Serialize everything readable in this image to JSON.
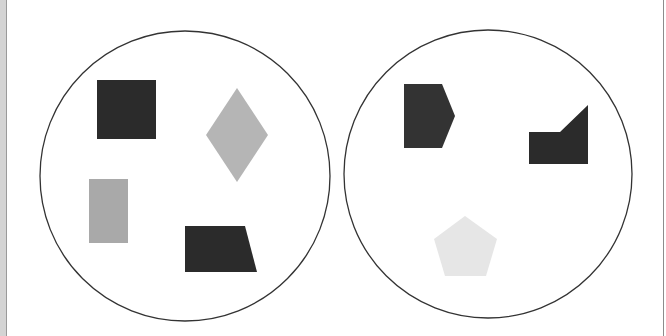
{
  "figure": {
    "width": 666,
    "height": 336,
    "background": "#ffffff",
    "panels": [
      {
        "name": "left-circle",
        "circle": {
          "cx": 185,
          "cy": 176,
          "r": 145,
          "stroke": "#333333"
        },
        "shapes": [
          {
            "type": "square",
            "color": "dark",
            "fill": "#2b2b2b",
            "points": "97,80 156,80 156,139 97,139"
          },
          {
            "type": "diamond",
            "color": "gray",
            "fill": "#b5b5b5",
            "points": "237,88 268,135 237,182 206,135"
          },
          {
            "type": "rectangle",
            "color": "gray",
            "fill": "#a9a9a9",
            "points": "89,179 128,179 128,243 89,243"
          },
          {
            "type": "trapezoid",
            "color": "dark",
            "fill": "#2b2b2b",
            "points": "185,226 245,226 257,272 185,272"
          }
        ]
      },
      {
        "name": "right-circle",
        "circle": {
          "cx": 488,
          "cy": 174,
          "r": 144,
          "stroke": "#333333"
        },
        "shapes": [
          {
            "type": "pentagon-arrow",
            "color": "dark",
            "fill": "#333333",
            "points": "404,84 442,84 455,116 442,148 404,148"
          },
          {
            "type": "notched-rectangle",
            "color": "dark",
            "fill": "#2b2b2b",
            "points": "529,132 560,132 588,105 588,164 529,164"
          },
          {
            "type": "pentagon",
            "color": "light",
            "fill": "#e6e6e6",
            "points": "465,216 497,239 486,276 445,276 434,239"
          }
        ]
      }
    ]
  }
}
